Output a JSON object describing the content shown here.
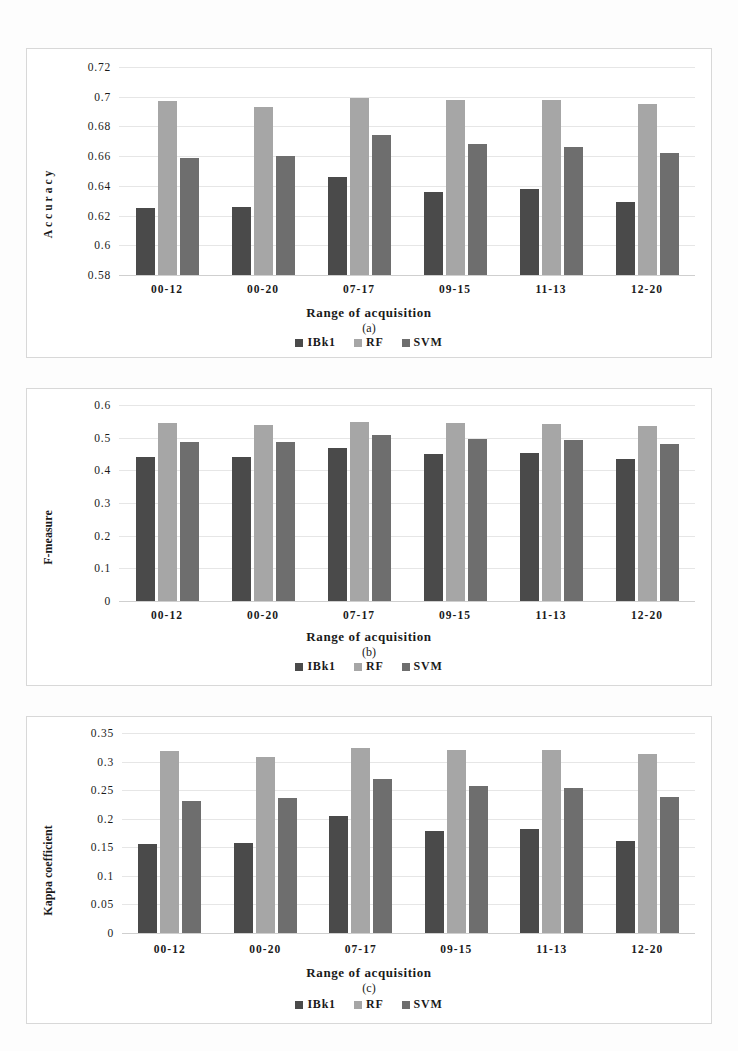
{
  "figure": {
    "panels": [
      "a",
      "b",
      "c"
    ],
    "series_names": [
      "IBk1",
      "RF",
      "SVM"
    ],
    "series_colors": [
      "#4a4a4a",
      "#a6a6a6",
      "#6e6e6e"
    ],
    "categories": [
      "00-12",
      "00-20",
      "07-17",
      "09-15",
      "11-13",
      "12-20"
    ],
    "xlabel": "Range of acquisition"
  },
  "legend": {
    "items": [
      {
        "label": "IBk1"
      },
      {
        "label": "RF"
      },
      {
        "label": "SVM"
      }
    ]
  },
  "panel_a": {
    "caption": "(a)",
    "ylabel": "Accuracy",
    "xlabel": "Range of acquisition",
    "ticks": [
      "0.72",
      "0.7",
      "0.68",
      "0.66",
      "0.64",
      "0.62",
      "0.6",
      "0.58"
    ],
    "categories": [
      "00-12",
      "00-20",
      "07-17",
      "09-15",
      "11-13",
      "12-20"
    ]
  },
  "panel_b": {
    "caption": "(b)",
    "ylabel": "F-measure",
    "xlabel": "Range of acquisition",
    "ticks": [
      "0.6",
      "0.5",
      "0.4",
      "0.3",
      "0.2",
      "0.1",
      "0"
    ],
    "categories": [
      "00-12",
      "00-20",
      "07-17",
      "09-15",
      "11-13",
      "12-20"
    ]
  },
  "panel_c": {
    "caption": "(c)",
    "ylabel": "Kappa coefficient",
    "xlabel": "Range of acquisition",
    "ticks": [
      "0.35",
      "0.3",
      "0.25",
      "0.2",
      "0.15",
      "0.1",
      "0.05",
      "0"
    ],
    "categories": [
      "00-12",
      "00-20",
      "07-17",
      "09-15",
      "11-13",
      "12-20"
    ]
  },
  "chart_data": [
    {
      "type": "bar",
      "panel": "a",
      "title": "(a)",
      "xlabel": "Range of acquisition",
      "ylabel": "Accuracy",
      "categories": [
        "00-12",
        "00-20",
        "07-17",
        "09-15",
        "11-13",
        "12-20"
      ],
      "series": [
        {
          "name": "IBk1",
          "color": "#4a4a4a",
          "values": [
            0.625,
            0.626,
            0.646,
            0.636,
            0.638,
            0.629
          ]
        },
        {
          "name": "RF",
          "color": "#a6a6a6",
          "values": [
            0.697,
            0.693,
            0.699,
            0.698,
            0.698,
            0.695
          ]
        },
        {
          "name": "SVM",
          "color": "#6e6e6e",
          "values": [
            0.659,
            0.66,
            0.674,
            0.668,
            0.666,
            0.662
          ]
        }
      ],
      "ylim": [
        0.58,
        0.72
      ],
      "ytick_step": 0.02,
      "grid": true,
      "legend_position": "bottom"
    },
    {
      "type": "bar",
      "panel": "b",
      "title": "(b)",
      "xlabel": "Range of acquisition",
      "ylabel": "F-measure",
      "categories": [
        "00-12",
        "00-20",
        "07-17",
        "09-15",
        "11-13",
        "12-20"
      ],
      "series": [
        {
          "name": "IBk1",
          "color": "#4a4a4a",
          "values": [
            0.44,
            0.441,
            0.468,
            0.449,
            0.452,
            0.436
          ]
        },
        {
          "name": "RF",
          "color": "#a6a6a6",
          "values": [
            0.546,
            0.539,
            0.547,
            0.545,
            0.543,
            0.537
          ]
        },
        {
          "name": "SVM",
          "color": "#6e6e6e",
          "values": [
            0.487,
            0.488,
            0.509,
            0.495,
            0.494,
            0.481
          ]
        }
      ],
      "ylim": [
        0,
        0.6
      ],
      "ytick_step": 0.1,
      "grid": true,
      "legend_position": "bottom"
    },
    {
      "type": "bar",
      "panel": "c",
      "title": "(c)",
      "xlabel": "Range of acquisition",
      "ylabel": "Kappa coefficient",
      "categories": [
        "00-12",
        "00-20",
        "07-17",
        "09-15",
        "11-13",
        "12-20"
      ],
      "series": [
        {
          "name": "IBk1",
          "color": "#4a4a4a",
          "values": [
            0.156,
            0.157,
            0.204,
            0.178,
            0.182,
            0.161
          ]
        },
        {
          "name": "RF",
          "color": "#a6a6a6",
          "values": [
            0.318,
            0.308,
            0.324,
            0.321,
            0.32,
            0.314
          ]
        },
        {
          "name": "SVM",
          "color": "#6e6e6e",
          "values": [
            0.231,
            0.237,
            0.27,
            0.257,
            0.253,
            0.238
          ]
        }
      ],
      "ylim": [
        0,
        0.35
      ],
      "ytick_step": 0.05,
      "grid": true,
      "legend_position": "bottom"
    }
  ]
}
